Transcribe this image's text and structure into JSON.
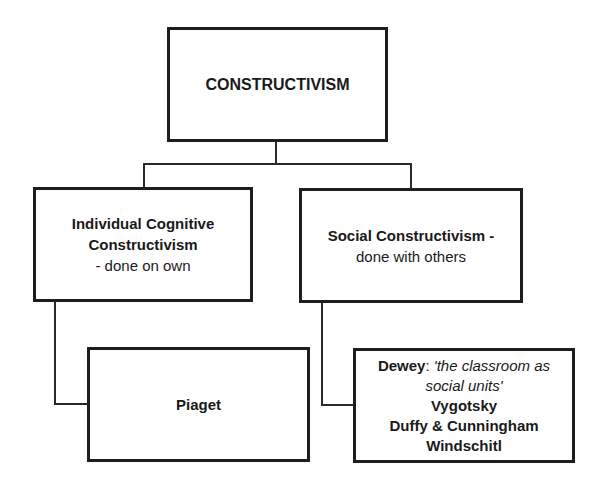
{
  "diagram": {
    "root": {
      "label": "CONSTRUCTIVISM"
    },
    "children": [
      {
        "title_lines": [
          "Individual Cognitive",
          "Constructivism"
        ],
        "subtitle": "- done on own",
        "leaf": {
          "lines": [
            "Piaget"
          ]
        }
      },
      {
        "title": "Social Constructivism -",
        "subtitle": "done with others",
        "leaf": {
          "dewey_name": "Dewey",
          "dewey_sep": ":",
          "dewey_quote_1": " 'the classroom as",
          "dewey_quote_2": "social units'",
          "names": [
            "Vygotsky",
            "Duffy & Cunningham",
            "Windschitl"
          ]
        }
      }
    ]
  }
}
